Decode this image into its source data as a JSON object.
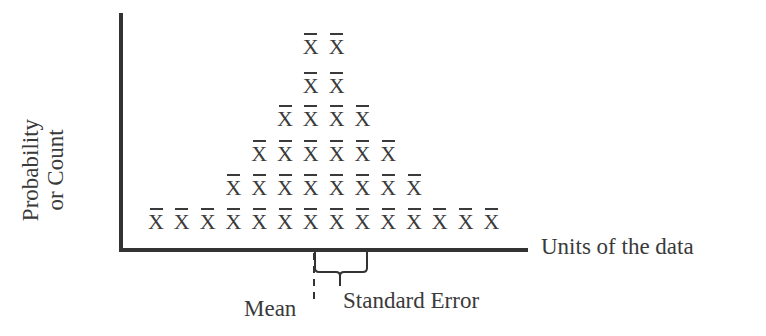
{
  "diagram": {
    "y_axis_label_line1": "Probability",
    "y_axis_label_line2": "or Count",
    "x_axis_label": "Units of the data",
    "mean_label": "Mean",
    "standard_error_label": "Standard Error",
    "symbol": "X",
    "symbol_meaning": "sample mean (x-bar)",
    "columns": 14,
    "column_counts": [
      1,
      1,
      1,
      2,
      3,
      4,
      6,
      6,
      4,
      3,
      2,
      1,
      1,
      1
    ],
    "row_counts_top_to_bottom": [
      2,
      4,
      4,
      6,
      8,
      14
    ],
    "colors": {
      "ink": "#3a3a3a",
      "background": "#ffffff"
    }
  }
}
